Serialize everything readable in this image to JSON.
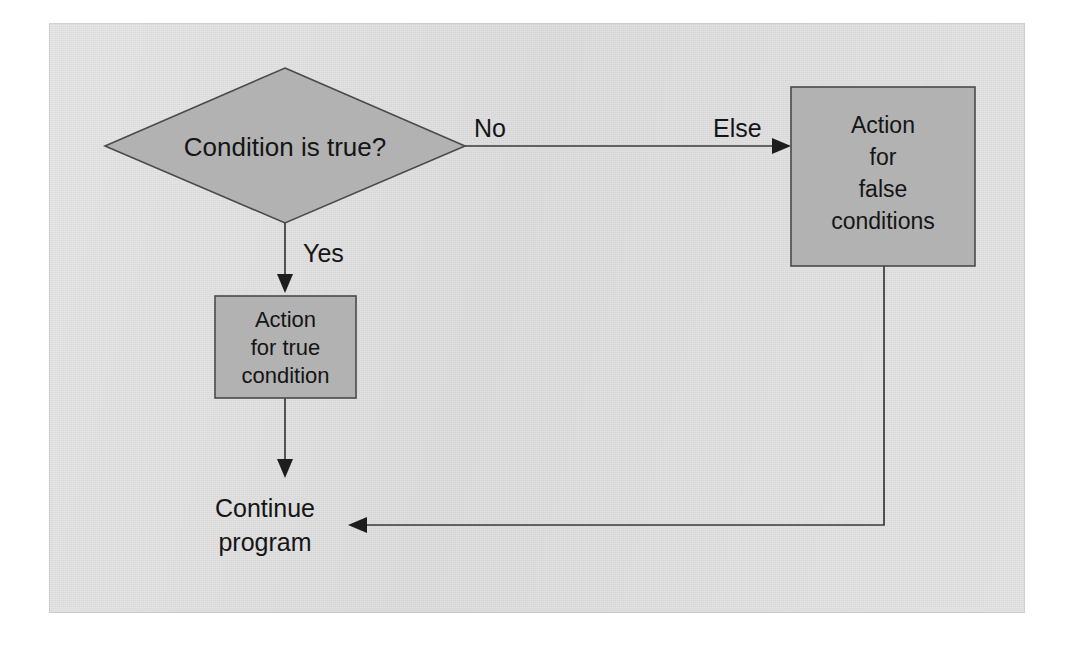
{
  "figure": {
    "kind": "flowchart",
    "panel": {
      "background_color": "#e1e1e1",
      "page_color": "#ffffff"
    },
    "palette": {
      "shape_fill": "#b2b2b2",
      "shape_stroke": "#4a4a4a",
      "connector": "#3a3a3a",
      "text": "#151515"
    }
  },
  "nodes": {
    "decision": {
      "shape": "diamond",
      "label": "Condition is true?",
      "lines": [
        "Condition is true?"
      ]
    },
    "true_action": {
      "shape": "rectangle",
      "label": "Action for true condition",
      "lines": [
        "Action",
        "for true",
        "condition"
      ]
    },
    "false_action": {
      "shape": "rectangle",
      "label": "Action for false conditions",
      "lines": [
        "Action",
        "for",
        "false",
        "conditions"
      ]
    },
    "continue": {
      "shape": "text",
      "label": "Continue program",
      "lines": [
        "Continue",
        "program"
      ]
    }
  },
  "edges": {
    "decision_to_true": {
      "label": "Yes",
      "from": "decision",
      "to": "true_action",
      "direction": "down"
    },
    "decision_to_false_start": {
      "label": "No",
      "from": "decision",
      "to": "false_action",
      "direction": "right"
    },
    "decision_to_false_end": {
      "label": "Else",
      "from": "decision",
      "to": "false_action",
      "direction": "right"
    },
    "true_to_continue": {
      "label": "",
      "from": "true_action",
      "to": "continue",
      "direction": "down"
    },
    "false_to_continue": {
      "label": "",
      "from": "false_action",
      "to": "continue",
      "direction": "down-left"
    }
  }
}
